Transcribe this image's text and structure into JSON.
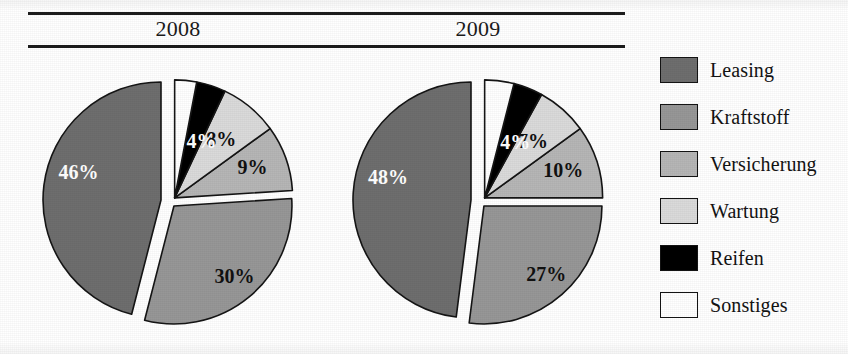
{
  "header": {
    "year_left": "2008",
    "year_right": "2009"
  },
  "legend": {
    "items": [
      {
        "label": "Leasing",
        "color": "#6e6e6e"
      },
      {
        "label": "Kraftstoff",
        "color": "#979797"
      },
      {
        "label": "Versicherung",
        "color": "#b6b6b6"
      },
      {
        "label": "Wartung",
        "color": "#dadada"
      },
      {
        "label": "Reifen",
        "color": "#000000"
      },
      {
        "label": "Sonstiges",
        "color": "#ffffff"
      }
    ]
  },
  "chart_data": [
    {
      "type": "pie",
      "title": "2008",
      "exploded": true,
      "categories": [
        "Leasing",
        "Kraftstoff",
        "Versicherung",
        "Wartung",
        "Reifen",
        "Sonstiges"
      ],
      "values": [
        46,
        30,
        9,
        8,
        4,
        3
      ],
      "labels": [
        "46%",
        "30%",
        "9%",
        "8%",
        "4%",
        ""
      ],
      "colors": [
        "#6e6e6e",
        "#979797",
        "#b6b6b6",
        "#dadada",
        "#000000",
        "#ffffff"
      ],
      "label_colors": [
        "light",
        "dark",
        "dark",
        "dark",
        "light",
        "dark"
      ],
      "unit": "%"
    },
    {
      "type": "pie",
      "title": "2009",
      "exploded": true,
      "categories": [
        "Leasing",
        "Kraftstoff",
        "Versicherung",
        "Wartung",
        "Reifen",
        "Sonstiges"
      ],
      "values": [
        48,
        27,
        10,
        7,
        4,
        4
      ],
      "labels": [
        "48%",
        "27%",
        "10%",
        "7%",
        "4%",
        ""
      ],
      "colors": [
        "#6e6e6e",
        "#979797",
        "#b6b6b6",
        "#dadada",
        "#000000",
        "#ffffff"
      ],
      "label_colors": [
        "light",
        "dark",
        "dark",
        "dark",
        "light",
        "dark"
      ],
      "unit": "%"
    }
  ]
}
